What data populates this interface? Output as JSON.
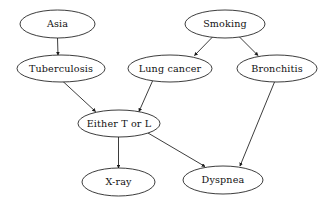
{
  "diagram": {
    "type": "directed-acyclic-graph",
    "canvas": {
      "width": 325,
      "height": 207
    },
    "style": {
      "background_color": "#ffffff",
      "node_fill": "#ffffff",
      "node_stroke": "#1a1a1a",
      "edge_color": "#1a1a1a",
      "text_color": "#111111",
      "node_shape": "ellipse",
      "arrowhead": "filled-triangle"
    },
    "nodes": [
      {
        "id": "asia",
        "label": "Asia",
        "cx": 57.5,
        "cy": 24.0,
        "rx": 37.5,
        "ry": 14.0
      },
      {
        "id": "smoking",
        "label": "Smoking",
        "cx": 225.0,
        "cy": 24.0,
        "rx": 40.0,
        "ry": 14.0
      },
      {
        "id": "tuberculosis",
        "label": "Tuberculosis",
        "cx": 61.0,
        "cy": 68.5,
        "rx": 44.0,
        "ry": 13.5
      },
      {
        "id": "lung_cancer",
        "label": "Lung cancer",
        "cx": 170.0,
        "cy": 68.5,
        "rx": 42.0,
        "ry": 13.5
      },
      {
        "id": "bronchitis",
        "label": "Bronchitis",
        "cx": 277.0,
        "cy": 68.5,
        "rx": 40.0,
        "ry": 13.5
      },
      {
        "id": "either_t_or_l",
        "label": "Either T or L",
        "cx": 119.0,
        "cy": 123.5,
        "rx": 41.0,
        "ry": 13.5
      },
      {
        "id": "xray",
        "label": "X-ray",
        "cx": 118.5,
        "cy": 182.0,
        "rx": 36.5,
        "ry": 14.0
      },
      {
        "id": "dyspnea",
        "label": "Dyspnea",
        "cx": 223.0,
        "cy": 180.0,
        "rx": 40.0,
        "ry": 14.0
      }
    ],
    "edges": [
      {
        "id": "asia-to-tuberculosis",
        "from": "asia",
        "to": "tuberculosis",
        "x1": 57.5,
        "y1": 38.0,
        "x2": 58.0,
        "y2": 55.0
      },
      {
        "id": "smoking-to-lung-cancer",
        "from": "smoking",
        "to": "lung_cancer",
        "x1": 213.0,
        "y1": 36.5,
        "x2": 194.5,
        "y2": 55.5
      },
      {
        "id": "smoking-to-bronchitis",
        "from": "smoking",
        "to": "bronchitis",
        "x1": 239.0,
        "y1": 36.5,
        "x2": 258.0,
        "y2": 55.5
      },
      {
        "id": "tuberculosis-to-either",
        "from": "tuberculosis",
        "to": "either_t_or_l",
        "x1": 62.5,
        "y1": 81.0,
        "x2": 95.5,
        "y2": 111.5
      },
      {
        "id": "lung-cancer-to-either",
        "from": "lung_cancer",
        "to": "either_t_or_l",
        "x1": 152.5,
        "y1": 81.0,
        "x2": 139.0,
        "y2": 111.5
      },
      {
        "id": "either-to-xray",
        "from": "either_t_or_l",
        "to": "xray",
        "x1": 118.5,
        "y1": 137.0,
        "x2": 118.5,
        "y2": 168.0
      },
      {
        "id": "either-to-dyspnea",
        "from": "either_t_or_l",
        "to": "dyspnea",
        "x1": 148.0,
        "y1": 133.0,
        "x2": 205.0,
        "y2": 166.5
      },
      {
        "id": "bronchitis-to-dyspnea",
        "from": "bronchitis",
        "to": "dyspnea",
        "x1": 274.5,
        "y1": 82.0,
        "x2": 240.0,
        "y2": 166.0
      }
    ]
  }
}
